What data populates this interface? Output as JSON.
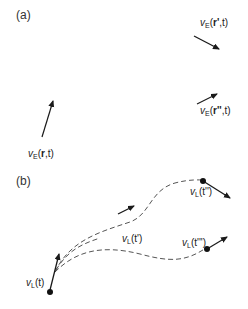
{
  "panels": [
    {
      "id": "a",
      "label": "(a)"
    },
    {
      "id": "b",
      "label": "(b)"
    }
  ],
  "panel_a": {
    "arrows": [
      {
        "name": "ve-r-prime",
        "label_base": "v",
        "label_sub": "E",
        "label_open": "(",
        "label_vec": "r'",
        "label_rest": ",t)"
      },
      {
        "name": "ve-r-double-prime",
        "label_base": "v",
        "label_sub": "E",
        "label_open": "(",
        "label_vec": "r''",
        "label_rest": ",t)"
      },
      {
        "name": "ve-r",
        "label_base": "v",
        "label_sub": "E",
        "label_open": "(",
        "label_vec": "r",
        "label_rest": ",t)"
      }
    ]
  },
  "panel_b": {
    "points": [
      {
        "name": "vl-t",
        "label_base": "v",
        "label_sub": "L",
        "label_rest": "(t)"
      },
      {
        "name": "vl-t-prime",
        "label_base": "v",
        "label_sub": "L",
        "label_rest": "(t')"
      },
      {
        "name": "vl-t-double-prime-upper",
        "label_base": "v",
        "label_sub": "L",
        "label_rest": "(t'')"
      },
      {
        "name": "vl-t-double-prime-lower",
        "label_base": "v",
        "label_sub": "L",
        "label_rest": "(t''')"
      }
    ]
  },
  "colors": {
    "ink": "#1a1a1a",
    "dash": "#555555"
  }
}
